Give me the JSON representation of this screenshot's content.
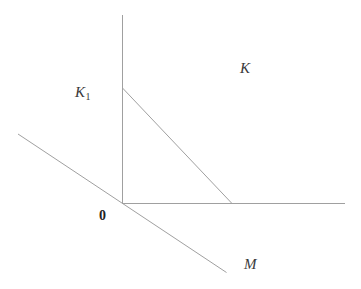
{
  "diagram": {
    "background_color": "#ffffff",
    "line_color": "#a0a0a0",
    "text_color": "#3a3a3a",
    "labels": {
      "cone": "K",
      "subcone_base": "K",
      "subcone_sub": "1",
      "origin": "0",
      "subspace": "M"
    }
  }
}
